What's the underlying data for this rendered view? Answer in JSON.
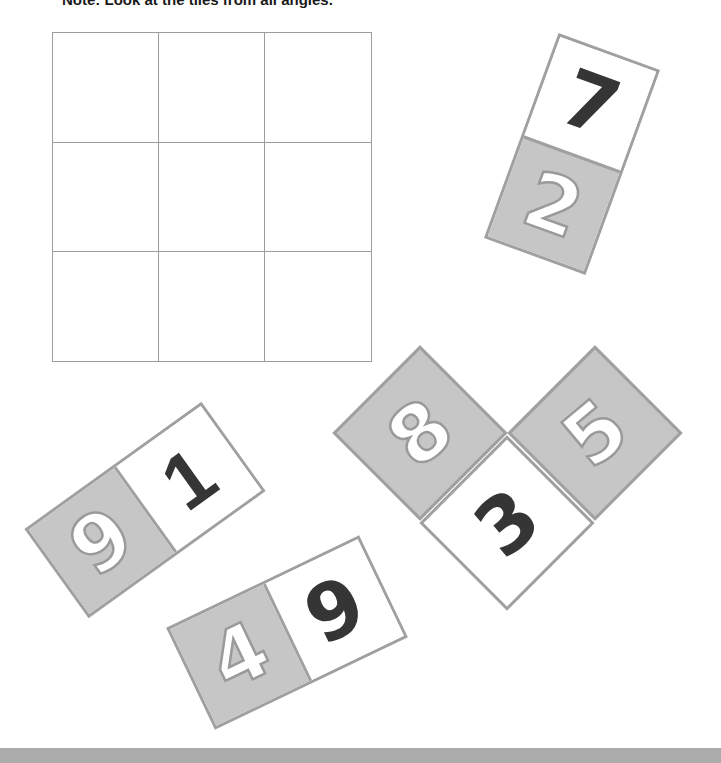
{
  "note": "Note: Look at the tiles from all angles.",
  "grid": {
    "rows": 3,
    "cols": 3,
    "cells": [
      "",
      "",
      "",
      "",
      "",
      "",
      "",
      "",
      ""
    ]
  },
  "colors": {
    "tile_gray": "#c6c6c6",
    "tile_border": "#a0a0a0",
    "digit_dark": "#353535",
    "grid_line": "#9c9c9c"
  },
  "tiles": [
    {
      "id": "tile-7-2",
      "orientation": "vertical",
      "rotation_deg": 20,
      "cells": [
        {
          "digit": "7",
          "style": "dark",
          "fill": "white"
        },
        {
          "digit": "2",
          "style": "outline",
          "fill": "gray"
        }
      ]
    },
    {
      "id": "tile-9-1",
      "orientation": "horizontal",
      "rotation_deg": -35.7,
      "cells": [
        {
          "digit": "9",
          "style": "outline",
          "fill": "gray"
        },
        {
          "digit": "1",
          "style": "dark",
          "fill": "white"
        }
      ]
    },
    {
      "id": "tile-4-9",
      "orientation": "horizontal",
      "rotation_deg": -25.6,
      "cells": [
        {
          "digit": "4",
          "style": "outline",
          "fill": "gray"
        },
        {
          "digit": "9",
          "style": "dark",
          "fill": "white"
        }
      ]
    },
    {
      "id": "tile-8-3-5",
      "orientation": "L-diamond",
      "rotation_deg": 45,
      "cells": [
        {
          "digit": "8",
          "style": "outline",
          "fill": "gray"
        },
        {
          "digit": "3",
          "style": "dark",
          "fill": "white"
        },
        {
          "digit": "5",
          "style": "outline",
          "fill": "gray"
        }
      ]
    }
  ]
}
